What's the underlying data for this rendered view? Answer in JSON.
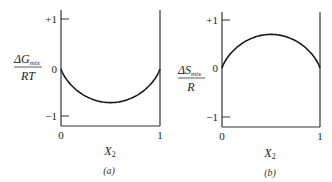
{
  "chart_data": [
    {
      "type": "line",
      "panel": "(a)",
      "title": "",
      "ylabel_num": "ΔG",
      "ylabel_sub": "mix",
      "ylabel_den": "RT",
      "xlabel_main": "X",
      "xlabel_sub": "2",
      "xticks": [
        "0",
        "1"
      ],
      "yticks": [
        "+1",
        "0",
        "−1"
      ],
      "xlim": [
        0,
        1
      ],
      "ylim": [
        -1.15,
        1.2
      ],
      "grid": false,
      "x": [
        0,
        0.1,
        0.2,
        0.3,
        0.4,
        0.5,
        0.6,
        0.7,
        0.8,
        0.9,
        1
      ],
      "values": [
        0,
        -0.325,
        -0.5,
        -0.611,
        -0.673,
        -0.693,
        -0.673,
        -0.611,
        -0.5,
        -0.325,
        0
      ]
    },
    {
      "type": "line",
      "panel": "(b)",
      "title": "",
      "ylabel_num": "ΔS",
      "ylabel_sub": "mix",
      "ylabel_den": "R",
      "xlabel_main": "X",
      "xlabel_sub": "2",
      "xticks": [
        "0",
        "1"
      ],
      "yticks": [
        "+1",
        "0",
        "−1"
      ],
      "xlim": [
        0,
        1
      ],
      "ylim": [
        -1.15,
        1.2
      ],
      "grid": false,
      "x": [
        0,
        0.1,
        0.2,
        0.3,
        0.4,
        0.5,
        0.6,
        0.7,
        0.8,
        0.9,
        1
      ],
      "values": [
        0,
        0.325,
        0.5,
        0.611,
        0.673,
        0.693,
        0.673,
        0.611,
        0.5,
        0.325,
        0
      ]
    }
  ],
  "panels": {
    "a": {
      "caption": "(a)",
      "ylabel_num": "ΔG",
      "ylabel_sub": "mix",
      "ylabel_den": "RT",
      "ytick_plus1": "+1",
      "ytick_zero": "0",
      "ytick_minus1": "−1",
      "xtick_zero": "0",
      "xtick_one": "1",
      "xlabel_main": "X",
      "xlabel_sub": "2"
    },
    "b": {
      "caption": "(b)",
      "ylabel_num": "ΔS",
      "ylabel_sub": "mix",
      "ylabel_den": "R",
      "ytick_plus1": "+1",
      "ytick_zero": "0",
      "ytick_minus1": "−1",
      "xtick_zero": "0",
      "xtick_one": "1",
      "xlabel_main": "X",
      "xlabel_sub": "2"
    }
  },
  "colors": {
    "line": "#1a1a1a",
    "axis": "#333333"
  }
}
